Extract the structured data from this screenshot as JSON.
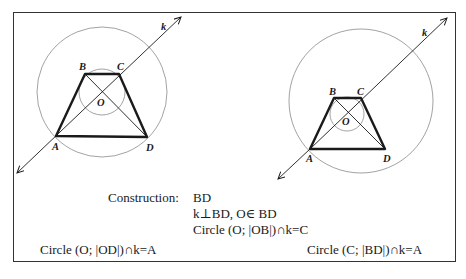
{
  "diagrams": [
    {
      "name": "left",
      "points": {
        "A": {
          "label": "A",
          "x": 56,
          "y": 136
        },
        "B": {
          "label": "B",
          "x": 85,
          "y": 74
        },
        "C": {
          "label": "C",
          "x": 119,
          "y": 74
        },
        "D": {
          "label": "D",
          "x": 147,
          "y": 137
        },
        "O": {
          "label": "O",
          "x": 102,
          "y": 92
        }
      },
      "line_label": "k",
      "caption": "Circle (O; |OD|)∩k=A"
    },
    {
      "name": "right",
      "points": {
        "A": {
          "label": "A",
          "x": 310,
          "y": 149
        },
        "B": {
          "label": "B",
          "x": 334,
          "y": 98
        },
        "C": {
          "label": "C",
          "x": 361,
          "y": 98
        },
        "D": {
          "label": "D",
          "x": 385,
          "y": 149
        },
        "O": {
          "label": "O",
          "x": 347,
          "y": 114
        }
      },
      "line_label": "k",
      "caption": "Circle (C; |BD|)∩k=A"
    }
  ],
  "construction": {
    "heading": "Construction:",
    "steps": [
      "BD",
      "k⊥BD, O∈ BD",
      "Circle (O; |OB|)∩k=C"
    ]
  },
  "colors": {
    "stroke": "#1a1a1a",
    "circle": "#8a8a8a",
    "frame": "#333333"
  }
}
